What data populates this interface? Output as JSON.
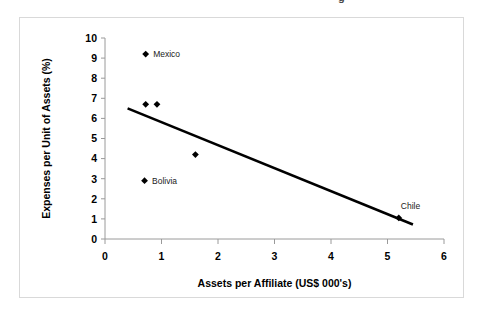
{
  "figure": {
    "clipped_text_above": "g",
    "background_color": "#ffffff",
    "frame_color": "#d9d9d9",
    "marker_color": "#000000",
    "trend_color": "#000000",
    "axis_color": "#9a9a9a"
  },
  "chart_data": {
    "type": "scatter",
    "title": "",
    "xlabel": "Assets per Affiliate (US$ 000's)",
    "ylabel": "Expenses per Unit of Assets (%)",
    "xlim": [
      0,
      6
    ],
    "ylim": [
      0,
      10
    ],
    "xticks": [
      "0",
      "1",
      "2",
      "3",
      "4",
      "5",
      "6"
    ],
    "yticks": [
      "0",
      "1",
      "2",
      "3",
      "4",
      "5",
      "6",
      "7",
      "8",
      "9",
      "10"
    ],
    "grid": false,
    "legend": "none",
    "points": [
      {
        "x": 0.72,
        "y": 9.2,
        "label": "Mexico",
        "label_pos": "right"
      },
      {
        "x": 0.72,
        "y": 6.7,
        "label": "",
        "label_pos": "none"
      },
      {
        "x": 0.92,
        "y": 6.7,
        "label": "",
        "label_pos": "none"
      },
      {
        "x": 1.6,
        "y": 4.2,
        "label": "",
        "label_pos": "none"
      },
      {
        "x": 0.7,
        "y": 2.9,
        "label": "Bolivia",
        "label_pos": "right"
      },
      {
        "x": 5.2,
        "y": 1.05,
        "label": "Chile",
        "label_pos": "above-right"
      }
    ],
    "trendline": {
      "type": "linear",
      "x_start": 0.4,
      "y_start": 6.5,
      "x_end": 5.45,
      "y_end": 0.72
    }
  }
}
